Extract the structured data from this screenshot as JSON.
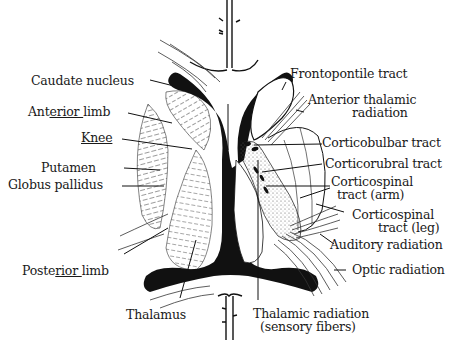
{
  "figure": {
    "colors": {
      "ink": "#111111",
      "stipple": "#555555",
      "background": "#ffffff"
    }
  },
  "labels_left": [
    {
      "id": "caudate-nucleus",
      "text": "Caudate nucleus"
    },
    {
      "id": "anterior-limb",
      "prefix": "Ant",
      "underlined": "erior ",
      "suffix": "limb"
    },
    {
      "id": "knee",
      "underlined": "Knee"
    },
    {
      "id": "putamen",
      "text": "Putamen"
    },
    {
      "id": "globus-pallidus",
      "text": "Globus pallidus"
    },
    {
      "id": "posterior-limb",
      "prefix": "Poste",
      "underlined": "rior ",
      "suffix": "limb"
    }
  ],
  "labels_bottom": [
    {
      "id": "thalamus",
      "text": "Thalamus"
    },
    {
      "id": "thalamic-radiation",
      "line1": "Thalamic radiation",
      "line2": "(sensory fibers)"
    }
  ],
  "labels_right": [
    {
      "id": "frontopontile-tract",
      "text": "Frontopontile tract"
    },
    {
      "id": "anterior-thalamic-radiation",
      "line1": "Anterior thalamic",
      "line2": "radiation"
    },
    {
      "id": "corticobulbar-tract",
      "text": "Corticobulbar tract"
    },
    {
      "id": "corticorubral-tract",
      "text": "Corticorubral tract"
    },
    {
      "id": "corticospinal-arm",
      "line1": "Corticospinal",
      "line2": "tract (arm)"
    },
    {
      "id": "corticospinal-leg",
      "line1": "Corticospinal",
      "line2": "tract (leg)"
    },
    {
      "id": "auditory-radiation",
      "text": "Auditory radiation"
    },
    {
      "id": "optic-radiation",
      "text": "Optic radiation"
    }
  ]
}
